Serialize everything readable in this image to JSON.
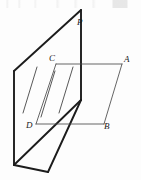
{
  "figure": {
    "type": "solid-geometry-line-drawing",
    "background_color": "#fdfdfd",
    "stroke_color": "#1c1c1c",
    "canvas": {
      "width": 141,
      "height": 180
    },
    "labels": [
      {
        "id": "P",
        "text": "P",
        "x": 77,
        "y": 18,
        "role": "apex-point-on-vertical-plane"
      },
      {
        "id": "A",
        "text": "A",
        "x": 124,
        "y": 55,
        "role": "horizontal-plane-corner-top-right"
      },
      {
        "id": "C",
        "text": "C",
        "x": 49,
        "y": 54,
        "role": "horizontal-plane-corner-top-left"
      },
      {
        "id": "D",
        "text": "D",
        "x": 26,
        "y": 121,
        "role": "horizontal-plane-corner-bottom-left"
      },
      {
        "id": "B",
        "text": "B",
        "x": 104,
        "y": 122,
        "role": "horizontal-plane-corner-bottom-right"
      }
    ],
    "vertical_plane": {
      "name": "beta-plane",
      "outline_points": "14,71 81,10 81,100 48,172 14,165",
      "left_edge": {
        "x1": 14,
        "y1": 71,
        "x2": 14,
        "y2": 165
      },
      "top_edge": {
        "x1": 14,
        "y1": 71,
        "x2": 81,
        "y2": 10
      },
      "right_edge_upper": {
        "x1": 81,
        "y1": 10,
        "x2": 81,
        "y2": 100
      },
      "right_edge_lower": {
        "x1": 81,
        "y1": 100,
        "x2": 48,
        "y2": 172
      },
      "bottom_edge": {
        "x1": 14,
        "y1": 165,
        "x2": 48,
        "y2": 172
      },
      "hatch_lines": [
        {
          "x1": 23,
          "y1": 113,
          "x2": 37,
          "y2": 67
        },
        {
          "x1": 41,
          "y1": 117,
          "x2": 55,
          "y2": 71
        },
        {
          "x1": 59,
          "y1": 113,
          "x2": 73,
          "y2": 67
        }
      ]
    },
    "horizontal_plane": {
      "name": "alpha-plane-ABCD",
      "corners": {
        "C": {
          "x": 56,
          "y": 64
        },
        "A": {
          "x": 122,
          "y": 64
        },
        "B": {
          "x": 104,
          "y": 124
        },
        "D": {
          "x": 36,
          "y": 124
        }
      },
      "edges": [
        {
          "from": "C",
          "to": "A",
          "x1": 56,
          "y1": 64,
          "x2": 122,
          "y2": 64
        },
        {
          "from": "A",
          "to": "B",
          "x1": 122,
          "y1": 64,
          "x2": 104,
          "y2": 124
        },
        {
          "from": "B",
          "to": "D",
          "x1": 104,
          "y1": 124,
          "x2": 36,
          "y2": 124
        },
        {
          "from": "D",
          "to": "C",
          "x1": 36,
          "y1": 124,
          "x2": 56,
          "y2": 64
        }
      ]
    },
    "intersection_line": {
      "name": "plane-intersection",
      "x1": 81,
      "y1": 100,
      "x2": 14,
      "y2": 165
    },
    "vertical_segment_PC": {
      "name": "segment-P-to-base",
      "x1": 81,
      "y1": 10,
      "x2": 81,
      "y2": 100
    }
  }
}
